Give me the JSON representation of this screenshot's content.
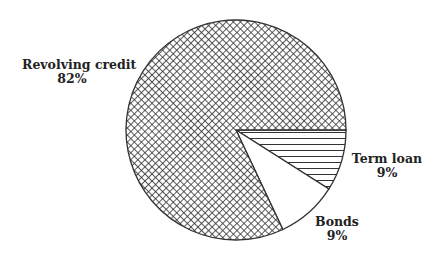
{
  "chart_data": {
    "type": "pie",
    "title": "",
    "categories": [
      "Revolving credit",
      "Term loan",
      "Bonds"
    ],
    "values": [
      82,
      9,
      9
    ],
    "unit": "%",
    "slices": [
      {
        "name": "Revolving credit",
        "value": 82,
        "label": "Revolving credit",
        "pct_label": "82%",
        "pattern": "crosshatch",
        "color": "#333333"
      },
      {
        "name": "Term loan",
        "value": 9,
        "label": "Term loan",
        "pct_label": "9%",
        "pattern": "horizontal-lines",
        "color": "#333333"
      },
      {
        "name": "Bonds",
        "value": 9,
        "label": "Bonds",
        "pct_label": "9%",
        "pattern": "solid-white",
        "color": "#ffffff"
      }
    ],
    "legend": "none (labels placed beside slices)",
    "start_angle_deg": 0,
    "direction": "clockwise"
  },
  "labels": {
    "revolving": {
      "name": "Revolving credit",
      "pct": "82%"
    },
    "term": {
      "name": "Term loan",
      "pct": "9%"
    },
    "bonds": {
      "name": "Bonds",
      "pct": "9%"
    }
  }
}
